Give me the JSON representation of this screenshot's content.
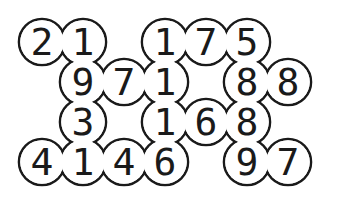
{
  "puzzle": {
    "colors": {
      "stroke": "#1a1a1a",
      "fill": "#ffffff",
      "text": "#1a1a1a"
    },
    "cell_radius": 23,
    "cells": [
      {
        "row": 0,
        "col": 0,
        "x": 42,
        "y": 42,
        "value": "2"
      },
      {
        "row": 0,
        "col": 1,
        "x": 83,
        "y": 42,
        "value": "1"
      },
      {
        "row": 0,
        "col": 3,
        "x": 165,
        "y": 42,
        "value": "1"
      },
      {
        "row": 0,
        "col": 4,
        "x": 206,
        "y": 42,
        "value": "7"
      },
      {
        "row": 0,
        "col": 5,
        "x": 247,
        "y": 42,
        "value": "5"
      },
      {
        "row": 1,
        "col": 1,
        "x": 83,
        "y": 82,
        "value": "9"
      },
      {
        "row": 1,
        "col": 2,
        "x": 124,
        "y": 82,
        "value": "7"
      },
      {
        "row": 1,
        "col": 3,
        "x": 165,
        "y": 82,
        "value": "1"
      },
      {
        "row": 1,
        "col": 5,
        "x": 247,
        "y": 82,
        "value": "8"
      },
      {
        "row": 1,
        "col": 6,
        "x": 288,
        "y": 82,
        "value": "8"
      },
      {
        "row": 2,
        "col": 1,
        "x": 83,
        "y": 122,
        "value": "3"
      },
      {
        "row": 2,
        "col": 3,
        "x": 165,
        "y": 122,
        "value": "1"
      },
      {
        "row": 2,
        "col": 4,
        "x": 206,
        "y": 122,
        "value": "6"
      },
      {
        "row": 2,
        "col": 5,
        "x": 247,
        "y": 122,
        "value": "8"
      },
      {
        "row": 3,
        "col": 0,
        "x": 42,
        "y": 162,
        "value": "4"
      },
      {
        "row": 3,
        "col": 1,
        "x": 83,
        "y": 162,
        "value": "1"
      },
      {
        "row": 3,
        "col": 2,
        "x": 124,
        "y": 162,
        "value": "4"
      },
      {
        "row": 3,
        "col": 3,
        "x": 165,
        "y": 162,
        "value": "6"
      },
      {
        "row": 3,
        "col": 5,
        "x": 247,
        "y": 162,
        "value": "9"
      },
      {
        "row": 3,
        "col": 6,
        "x": 288,
        "y": 162,
        "value": "7"
      }
    ]
  }
}
